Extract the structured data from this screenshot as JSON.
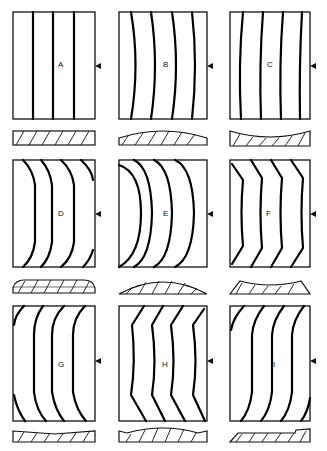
{
  "figure": {
    "panels": [
      {
        "label": "A",
        "pattern": "straight parallel grain",
        "section": "flat rectangular"
      },
      {
        "label": "B",
        "pattern": "convex curved grain (bowed left)",
        "section": "convex top"
      },
      {
        "label": "C",
        "pattern": "slightly concave curved grain",
        "section": "concave top"
      },
      {
        "label": "D",
        "pattern": "grain bent at ends toward left",
        "section": "rounded ends, flat top"
      },
      {
        "label": "E",
        "pattern": "strongly curved grain (bowed left)",
        "section": "domed / arched"
      },
      {
        "label": "F",
        "pattern": "chevron grain, points left",
        "section": "concave with raised ends"
      },
      {
        "label": "G",
        "pattern": "grain curved at top and bottom corners",
        "section": "thin, slightly tapered"
      },
      {
        "label": "H",
        "pattern": "angular chevron grain",
        "section": "wavy top"
      },
      {
        "label": "I",
        "pattern": "S-shaped offset grain",
        "section": "tapered with stepped right end"
      }
    ],
    "marker": "arrowhead pointer on right edge of each panel"
  }
}
